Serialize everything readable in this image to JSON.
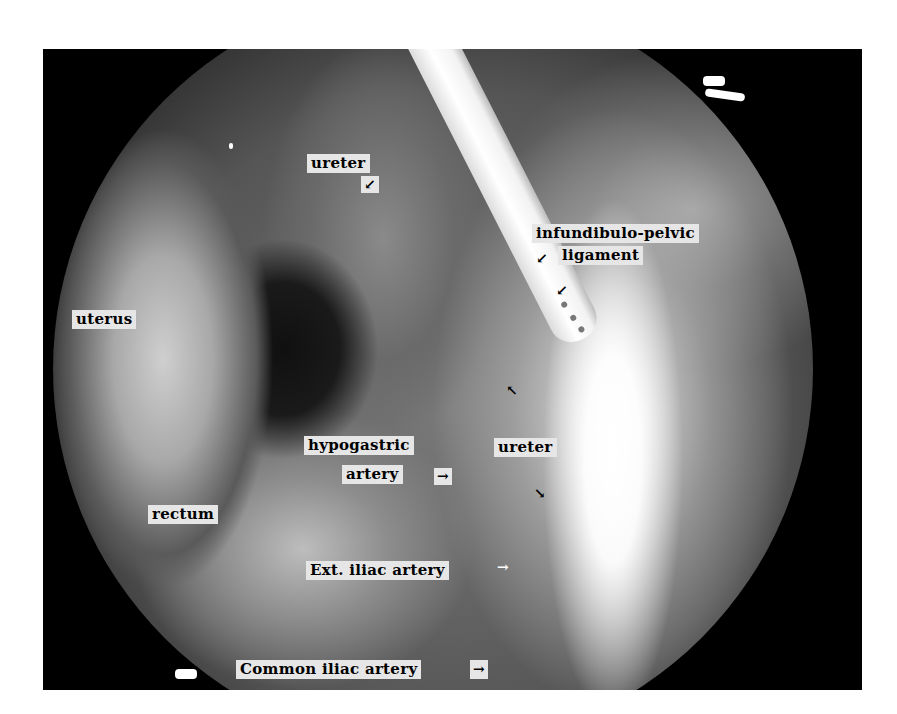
{
  "image": {
    "description": "Laparoscopic view of the pelvic side wall with anatomical labels",
    "background_color": "#ffffff",
    "frame_color": "#000000",
    "label_background": "#e6e6e6"
  },
  "labels": {
    "ureter_top": "ureter",
    "infundibulo_pelvic_1": "infundibulo-pelvic",
    "infundibulo_pelvic_2": "ligament",
    "uterus": "uterus",
    "hypogastric_1": "hypogastric",
    "hypogastric_2": "artery",
    "ureter_mid": "ureter",
    "rectum": "rectum",
    "ext_iliac": "Ext. iliac artery",
    "common_iliac": "Common iliac artery"
  },
  "arrows": {
    "ureter_top": "↙",
    "ip_ligament_1": "↙",
    "ip_ligament_2": "↙",
    "ureter_up": "↖",
    "ureter_down": "↘",
    "hypogastric": "→",
    "ext_iliac": "→",
    "common_iliac": "→"
  }
}
